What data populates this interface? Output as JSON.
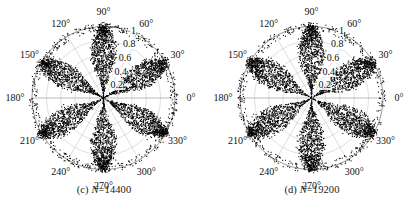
{
  "figure": {
    "background": "#ffffff",
    "marker_color": "#000000",
    "grid_color": "#b9b9b9",
    "axis_color": "#8c8c8c"
  },
  "panels": [
    {
      "id": "panel-c",
      "caption_prefix": "(c)",
      "caption_var": "N",
      "caption_value": "=14400",
      "caption": "(c) N=14400",
      "chart_data": {
        "type": "scatter",
        "projection": "polar",
        "title": "(c) N=14400",
        "n_points": 14400,
        "theta_unit": "degrees",
        "theta_tick_labels": [
          "0°",
          "30°",
          "60°",
          "90°",
          "120°",
          "150°",
          "180°",
          "210°",
          "240°",
          "270°",
          "300°",
          "330°"
        ],
        "theta_ticks": [
          0,
          30,
          60,
          90,
          120,
          150,
          180,
          210,
          240,
          270,
          300,
          330
        ],
        "theta_direction": "counterclockwise",
        "theta_zero_location": "E",
        "r_tick_labels": [
          "0.2",
          "0.4",
          "0.6",
          "0.8",
          "1"
        ],
        "r_ticks": [
          0.2,
          0.4,
          0.6,
          0.8,
          1.0
        ],
        "rlim": [
          0,
          1
        ],
        "r_label_angle": 73,
        "grid": true,
        "legend": "none",
        "lobes": 6,
        "lobe_centers_deg": [
          30,
          90,
          150,
          210,
          270,
          330
        ],
        "lobe_peak_r": 1.0,
        "lobe_angular_halfwidth_deg": 17,
        "description": "Six-lobed rose-shaped dense point cloud; each lobe spans from the origin to r=1 along the 30-degree-offset axes, with scattered outliers near the unit circle."
      }
    },
    {
      "id": "panel-d",
      "caption_prefix": "(d)",
      "caption_var": "N",
      "caption_value": "=19200",
      "caption": "(d) N=19200",
      "chart_data": {
        "type": "scatter",
        "projection": "polar",
        "title": "(d) N=19200",
        "n_points": 19200,
        "theta_unit": "degrees",
        "theta_tick_labels": [
          "0°",
          "30°",
          "60°",
          "90°",
          "120°",
          "150°",
          "180°",
          "210°",
          "240°",
          "270°",
          "300°",
          "330°"
        ],
        "theta_ticks": [
          0,
          30,
          60,
          90,
          120,
          150,
          180,
          210,
          240,
          270,
          300,
          330
        ],
        "theta_direction": "counterclockwise",
        "theta_zero_location": "E",
        "r_tick_labels": [
          "0.2",
          "0.4",
          "0.6",
          "0.8",
          "1"
        ],
        "r_ticks": [
          0.2,
          0.4,
          0.6,
          0.8,
          1.0
        ],
        "rlim": [
          0,
          1
        ],
        "r_label_angle": 73,
        "grid": true,
        "legend": "none",
        "lobes": 6,
        "lobe_centers_deg": [
          30,
          90,
          150,
          210,
          270,
          330
        ],
        "lobe_peak_r": 1.0,
        "lobe_angular_halfwidth_deg": 18,
        "description": "Six-lobed rose-shaped dense point cloud, slightly broader and denser than panel (c); lobes reach r=1 with scattered outliers near the unit circle."
      }
    }
  ]
}
